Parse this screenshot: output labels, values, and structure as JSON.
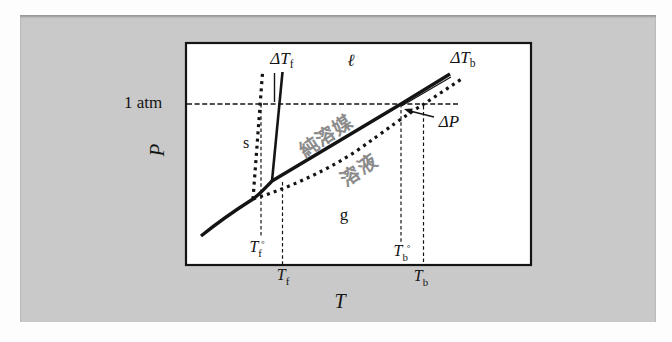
{
  "figure": {
    "kind": "pressure-temperature phase diagram showing freezing-point depression and boiling-point elevation",
    "pressure_reference_label": "1 atm"
  },
  "axes": {
    "y_label": "P",
    "x_label": "T"
  },
  "regions": {
    "solid": "s",
    "liquid": "ℓ",
    "gas": "g"
  },
  "curve_labels": {
    "pure_solvent": "純溶媒",
    "solution": "溶液"
  },
  "annotations": {
    "delta_tf": {
      "base": "ΔT",
      "sub": "f"
    },
    "delta_tb": {
      "base": "ΔT",
      "sub": "b"
    },
    "delta_p": "ΔP"
  },
  "ticks": {
    "tf0": {
      "base": "T",
      "sub": "f",
      "sup": "°"
    },
    "tf": {
      "base": "T",
      "sub": "f"
    },
    "tb0": {
      "base": "T",
      "sub": "b",
      "sup": "°"
    },
    "tb": {
      "base": "T",
      "sub": "b"
    }
  },
  "line_semantics": {
    "solid_curves": "pure solvent (sublimation, fusion, vaporization)",
    "dotted_curves": "solution (fusion, vaporization)"
  },
  "colors": {
    "ink": "#141414",
    "panel_gray": "#c9c9c9",
    "plot_background": "#ffffff",
    "muted_label_gray": "#8b8b8b"
  }
}
